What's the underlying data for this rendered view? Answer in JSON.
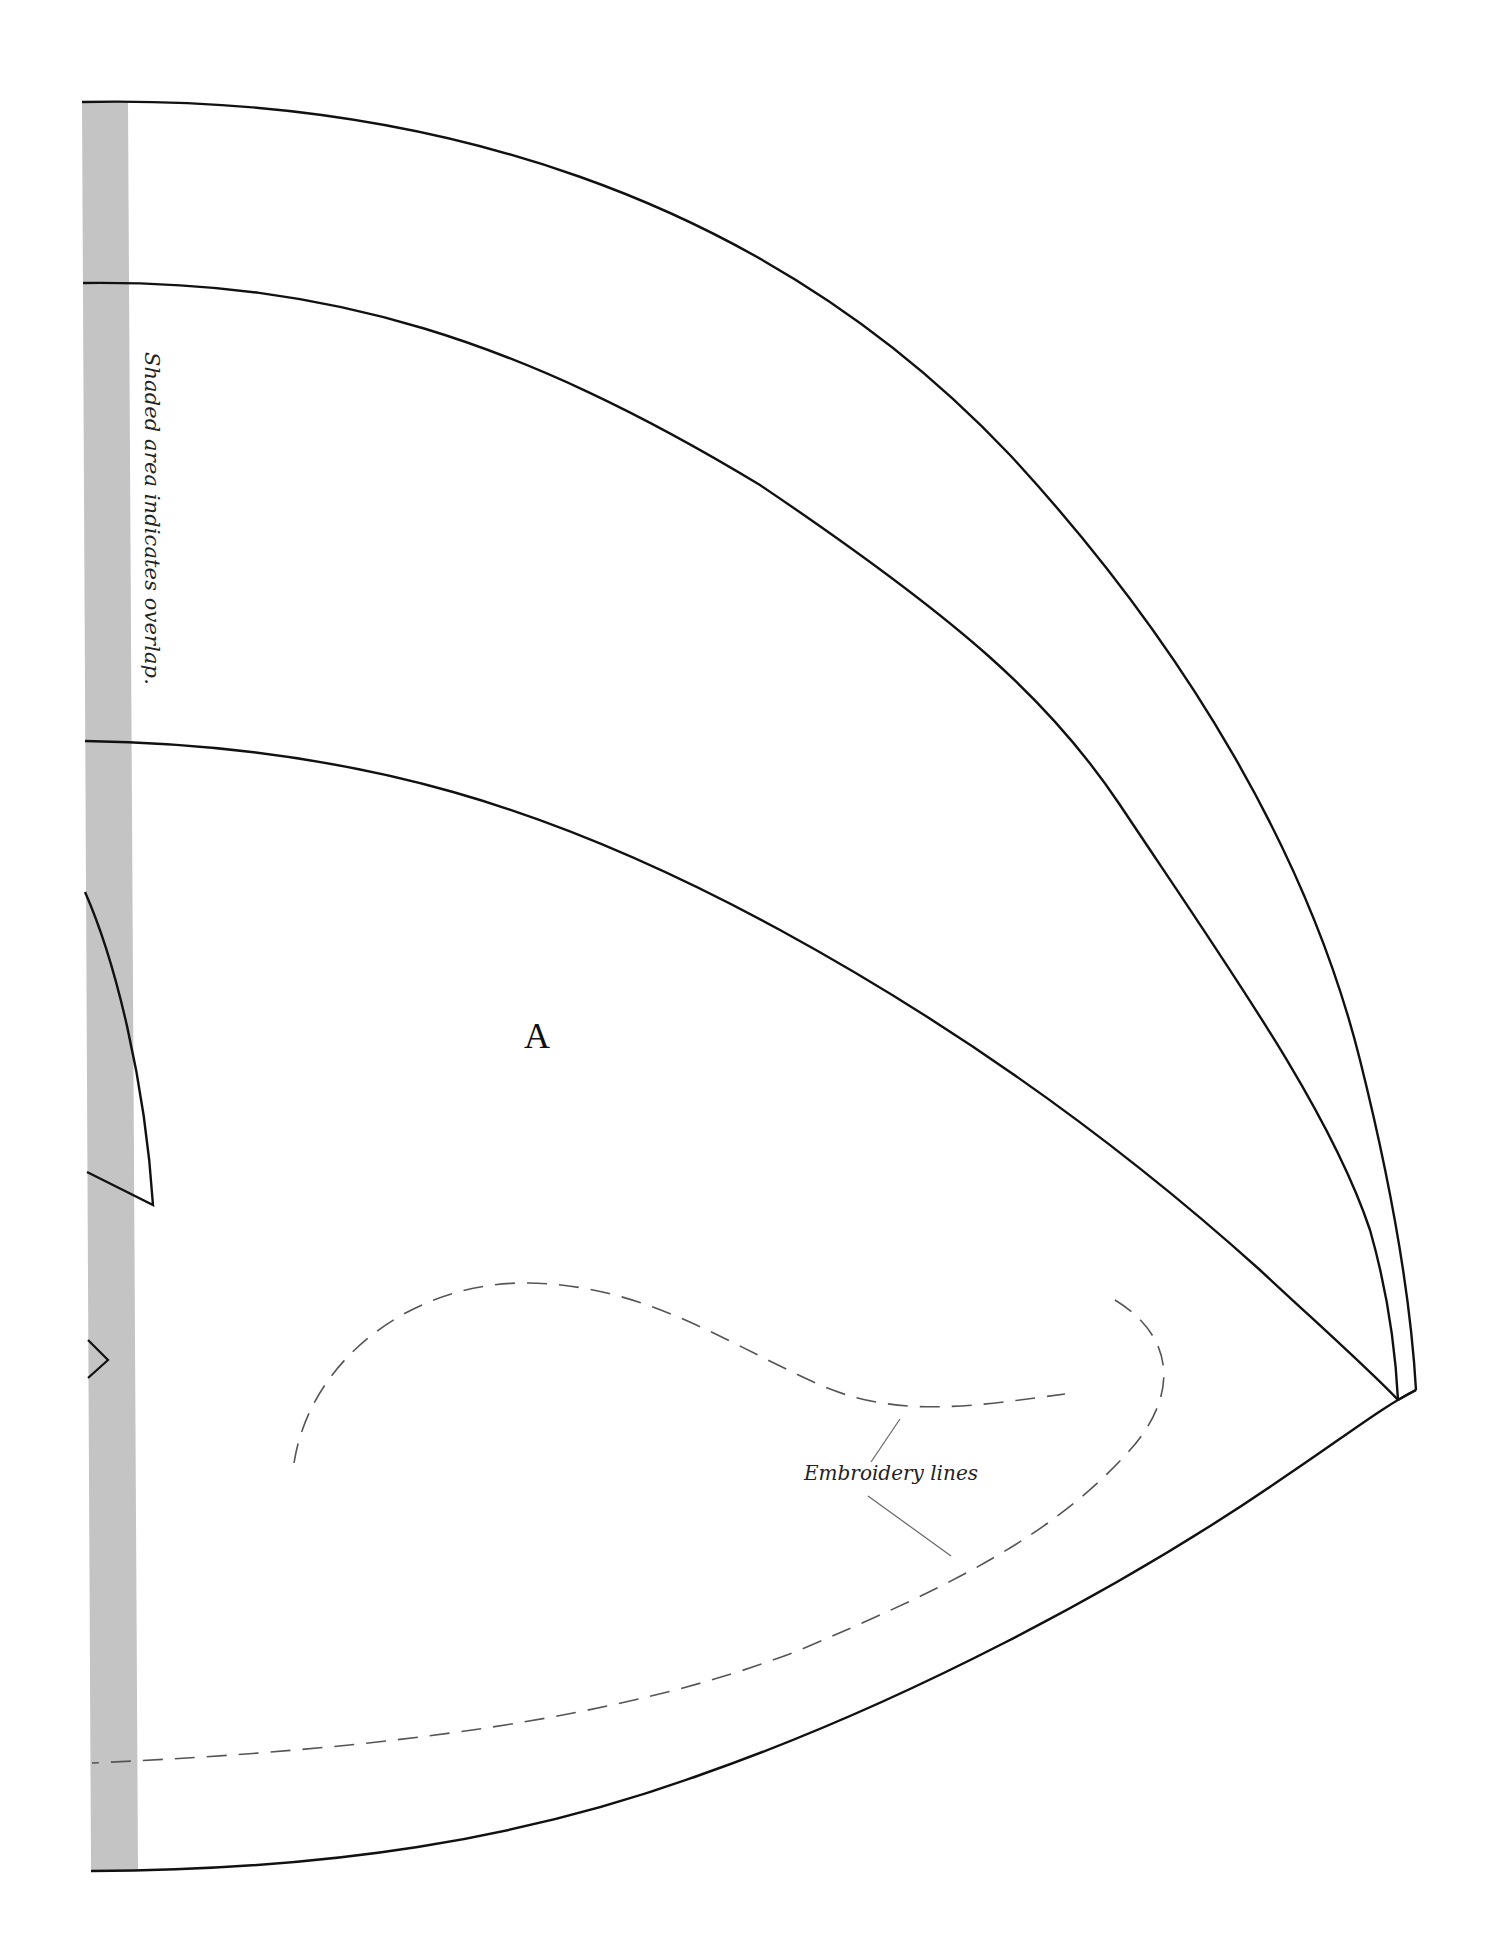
{
  "document": {
    "type": "sewing-pattern-piece",
    "piece_label": "A",
    "annotations": {
      "overlap_note": "Shaded area indicates overlap.",
      "embroidery_label": "Embroidery lines"
    }
  },
  "styles": {
    "outline_color": "#111111",
    "overlap_shade_color": "#c4c4c4",
    "embroidery_dash_color": "#555555",
    "leader_line_color": "#666666",
    "background": "#ffffff"
  },
  "legend": [
    {
      "item": "shaded-area",
      "meaning": "Shaded area indicates overlap."
    },
    {
      "item": "dashed-line",
      "meaning": "Embroidery lines"
    }
  ]
}
